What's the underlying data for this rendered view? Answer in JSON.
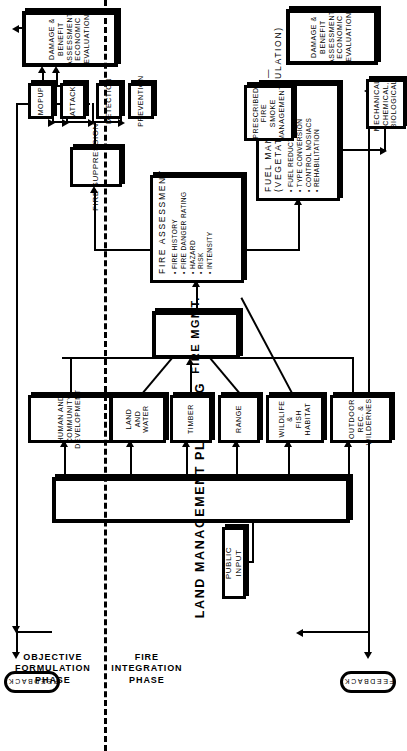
{
  "figure": {
    "phases": [
      {
        "id": "objective-formulation",
        "label": "OBJECTIVE\nFORMULATION\nPHASE"
      },
      {
        "id": "fire-integration",
        "label": "FIRE\nINTEGRATION\nPHASE"
      }
    ],
    "feedback_label": "FEEDBACK",
    "colors": {
      "ink": "#000000",
      "paper": "#ffffff"
    }
  },
  "nodes": {
    "public_input": "PUBLIC INPUT",
    "land_management_planning": "LAND MANAGEMENT PLANNING",
    "human_and_community_development": "HUMAN AND COMMUNITY\nDEVELOPMENT",
    "land_and_water": "LAND AND WATER",
    "timber": "TIMBER",
    "range": "RANGE",
    "wildlife_fish_habitat": "WILDLIFE &\nFISH HABITAT",
    "outdoor_rec_wilderness": "OUTDOOR REC. &\nWILDERNESS",
    "fire_mgmt": "FIRE  MGMT.",
    "fire_suppression": "FIRE  SUPPRESSION",
    "prevention": "PREVENTION",
    "detection": "DETECTION",
    "attack": "ATTACK",
    "mopup": "MOPUP",
    "damage_benefit_suppression": "DAMAGE & BENEFIT\nASSESSMENT\nECONOMIC  EVALUATION",
    "prescribed_fire": "PRESCRIBED  FIRE\nSMOKE MANAGEMENT",
    "mechanical_chemical_biological": "MECHANICAL,\nCHEMICAL,\nBIOLOGICAL",
    "damage_benefit_fuel": "DAMAGE & BENEFIT\nASSESSMENT\nECONOMIC EVALUATION",
    "feedback_top": "FEEDBACK",
    "feedback_bottom": "FEEDBACK"
  },
  "fire_assessment": {
    "header": "FIRE   ASSESSMENT",
    "items": [
      "FIRE HISTORY",
      "FIRE DANGER RATING",
      "HAZARD",
      "RISK",
      "INTENSITY"
    ]
  },
  "fuel_management": {
    "header": "FUEL  MANAGEMENT —",
    "subheader": "(VEGETATIVE MANIPULATION)",
    "items": [
      "FUEL  REDUCTION",
      "TYPE CONVERSION",
      "CONTROL MOSIACS",
      "REHABILITATION"
    ]
  }
}
